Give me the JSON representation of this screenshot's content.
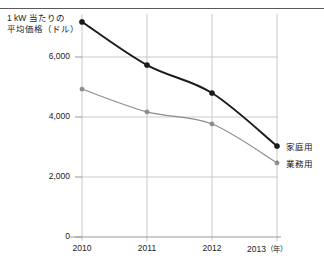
{
  "figure": {
    "top_caption_fragment": "",
    "axis_title_line1": "1 kW 当たりの",
    "axis_title_line2": "平均価格（ドル）"
  },
  "chart_data": {
    "type": "line",
    "title": "",
    "subtitle": "",
    "xlabel": "年",
    "ylabel": "1 kW 当たりの平均価格（ドル）",
    "categories": [
      "2010",
      "2011",
      "2012",
      "2013"
    ],
    "x_tick_labels": [
      "2010",
      "2011",
      "2012",
      "2013"
    ],
    "x_unit_label": "（年）",
    "y_tick_labels": [
      "0",
      "2,000",
      "4,000",
      "6,000"
    ],
    "y_ticks": [
      0,
      2000,
      4000,
      6000
    ],
    "ylim": [
      0,
      7600
    ],
    "grid": true,
    "legend_position": "right-end-of-line",
    "series": [
      {
        "name": "家庭用",
        "color": "#1a1a1a",
        "values": [
          7170,
          5730,
          4800,
          3030
        ]
      },
      {
        "name": "業務用",
        "color": "#8c8c8c",
        "values": [
          4930,
          4170,
          3770,
          2470
        ]
      }
    ]
  }
}
